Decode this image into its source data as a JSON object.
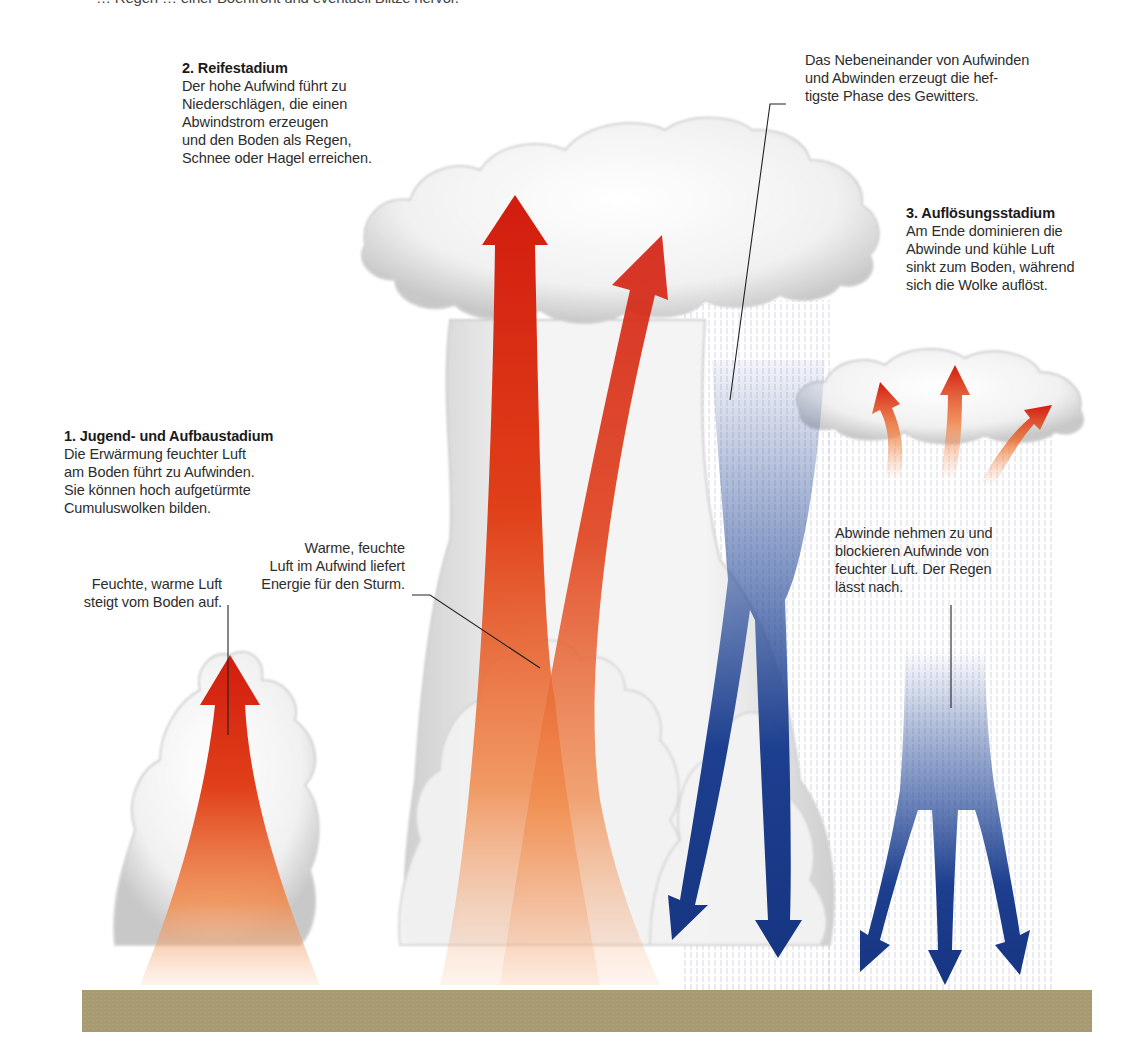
{
  "top_caption_clipped": "… Regen … einer Böenfront und eventuell Blitze hervor.",
  "stages": [
    {
      "title": "1. Jugend- und Aufbaustadium",
      "lines": [
        "Die Erwärmung feuchter Luft",
        "am Boden führt zu Aufwinden.",
        "Sie können hoch aufgetürmte",
        "Cumuluswolken bilden."
      ]
    },
    {
      "title": "2. Reifestadium",
      "lines": [
        "Der hohe Aufwind führt zu",
        "Niederschlägen, die einen",
        "Abwindstrom erzeugen",
        "und den Boden als Regen,",
        "Schnee oder Hagel erreichen."
      ]
    },
    {
      "title": "3. Auflösungsstadium",
      "lines": [
        "Am Ende dominieren die",
        "Abwinde und kühle Luft",
        "sinkt zum Boden, während",
        "sich die Wolke auflöst."
      ]
    }
  ],
  "annotations": {
    "moist_air": [
      "Feuchte, warme Luft",
      "steigt vom Boden auf."
    ],
    "warm_air_energy": [
      "Warme, feuchte",
      "Luft im Aufwind liefert",
      "Energie für den Sturm."
    ],
    "coexistence": [
      "Das Nebeneinander von Aufwinden",
      "und Abwinden erzeugt die hef-",
      "tigste Phase des Gewitters."
    ],
    "downdrafts_increase": [
      "Abwinde nehmen zu und",
      "blockieren Aufwinde von",
      "feuchter Luft. Der Regen",
      "lässt nach."
    ]
  },
  "colors": {
    "updraft_red": "#d21c0e",
    "updraft_orange": "#f08a4b",
    "downdraft_blue": "#1d3f8f",
    "ground": "#a89a72",
    "cloud_shadow": "#c9c9c9"
  }
}
